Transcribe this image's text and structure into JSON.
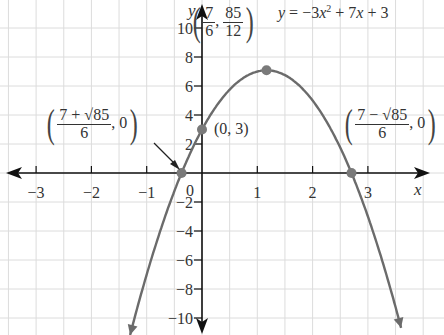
{
  "chart_data": {
    "type": "line",
    "title": "",
    "function": "y = -3x^2 + 7x + 3",
    "equation_label": {
      "lhs": "y",
      "rhs_parts": [
        "−3",
        "x",
        "2",
        " + 7",
        "x",
        " + 3"
      ]
    },
    "xlabel": "x",
    "ylabel": "y",
    "xlim": [
      -3.6,
      4.0
    ],
    "ylim": [
      -11,
      12
    ],
    "x_ticks": [
      -3,
      -2,
      -1,
      1,
      2,
      3
    ],
    "x_tick_labels": [
      "−3",
      "−2",
      "−1",
      "1",
      "2",
      "3"
    ],
    "y_ticks": [
      -10,
      -8,
      -6,
      -4,
      -2,
      2,
      4,
      6,
      8,
      10
    ],
    "y_tick_labels": [
      "−10",
      "−8",
      "−6",
      "−4",
      "−2",
      "2",
      "4",
      "6",
      "8",
      "10"
    ],
    "origin_label": "0",
    "grid": true,
    "grid_x_step": 0.5,
    "grid_y_step": 2,
    "curve_color": "#6b6b6b",
    "point_color": "#7a7a7a",
    "axis_color": "#111111",
    "grid_color": "#dcdcdc",
    "points": [
      {
        "name": "vertex",
        "x": 1.1667,
        "y": 7.0833,
        "label_num_x": "7",
        "label_den_x": "6",
        "label_num_y": "85",
        "label_den_y": "12"
      },
      {
        "name": "y-intercept",
        "x": 0,
        "y": 3,
        "label": "(0, 3)"
      },
      {
        "name": "x-intercept-left",
        "x": -0.3699,
        "y": 0,
        "label_num": "7 + √85",
        "label_den": "6",
        "label_y": "0"
      },
      {
        "name": "x-intercept-right",
        "x": 2.7032,
        "y": 0,
        "label_num": "7 − √85",
        "label_den": "6",
        "label_y": "0"
      }
    ],
    "curve_samples": {
      "x": [
        -1.3,
        -1.0,
        -0.5,
        0,
        0.5,
        1.0,
        1.1667,
        1.5,
        2.0,
        2.5,
        3.0,
        3.6
      ],
      "y": [
        -11.17,
        -7.0,
        -1.25,
        3.0,
        5.75,
        7.0,
        7.08,
        6.75,
        5.0,
        1.75,
        -3.0,
        -10.68
      ]
    }
  }
}
